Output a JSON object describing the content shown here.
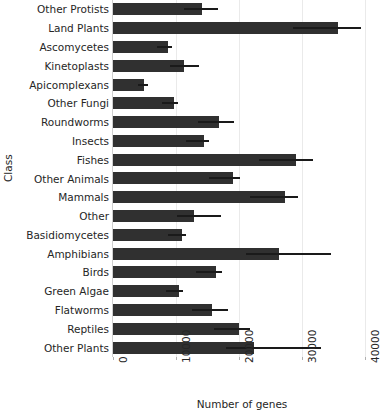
{
  "chart_data": {
    "type": "bar",
    "orientation": "horizontal",
    "title": "Average number of genes per class",
    "xlabel": "Number of genes",
    "ylabel": "Class",
    "xlim": [
      0,
      41000
    ],
    "xticks": [
      0,
      10000,
      20000,
      30000,
      40000
    ],
    "xtick_labels": [
      "0",
      "10000",
      "20000",
      "30000",
      "40000"
    ],
    "grid": "vertical",
    "legend": "none",
    "bar_color": "#303030",
    "error_color": "#1a1a1a",
    "grid_color": "#eaeaea",
    "categories": [
      "Other Protists",
      "Land Plants",
      "Ascomycetes",
      "Kinetoplasts",
      "Apicomplexans",
      "Other Fungi",
      "Roundworms",
      "Insects",
      "Fishes",
      "Other Animals",
      "Mammals",
      "Other",
      "Basidiomycetes",
      "Amphibians",
      "Birds",
      "Green Algae",
      "Flatworms",
      "Reptiles",
      "Other Plants"
    ],
    "values": [
      14200,
      35800,
      8700,
      11300,
      4900,
      9700,
      16900,
      14500,
      29100,
      19000,
      27300,
      12800,
      10900,
      26400,
      16400,
      10500,
      15700,
      20100,
      22400
    ],
    "error_high": [
      16700,
      39400,
      9300,
      13700,
      5600,
      10400,
      19200,
      15300,
      31800,
      20200,
      29400,
      17200,
      11600,
      34600,
      17400,
      11200,
      18200,
      21800,
      33100
    ]
  }
}
